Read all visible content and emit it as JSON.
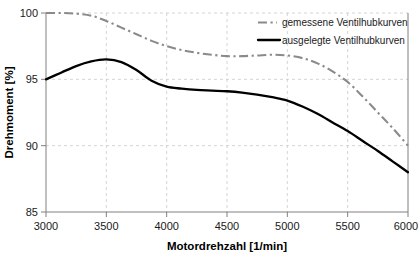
{
  "chart_data": {
    "type": "line",
    "title": "",
    "xlabel": "Motordrehzahl [1/min]",
    "ylabel": "Drehmoment [%]",
    "xlim": [
      3000,
      6000
    ],
    "ylim": [
      85,
      100
    ],
    "xticks": [
      3000,
      3500,
      4000,
      4500,
      5000,
      5500,
      6000
    ],
    "yticks": [
      85,
      90,
      95,
      100
    ],
    "xtick_labels": [
      "3000",
      "3500",
      "4000",
      "4500",
      "5000",
      "5500",
      "6000"
    ],
    "ytick_labels": [
      "85",
      "90",
      "95",
      "100"
    ],
    "grid": true,
    "grid_style": "dashed",
    "legend_position": "top-right",
    "series": [
      {
        "name": "gemessene Ventilhubkurven",
        "style": "dash-dot",
        "color": "#8a8a8a",
        "x": [
          3000,
          3125,
          3250,
          3375,
          3500,
          3625,
          3750,
          3875,
          4000,
          4125,
          4250,
          4375,
          4500,
          4625,
          4750,
          4875,
          5000,
          5125,
          5250,
          5375,
          5500,
          5625,
          5750,
          5875,
          6000
        ],
        "values": [
          100.0,
          100.0,
          99.95,
          99.8,
          99.4,
          98.9,
          98.4,
          97.9,
          97.5,
          97.2,
          97.0,
          96.85,
          96.75,
          96.75,
          96.8,
          96.85,
          96.8,
          96.6,
          96.2,
          95.6,
          94.8,
          93.7,
          92.5,
          91.3,
          90.0
        ]
      },
      {
        "name": "ausgelegte Ventilhubkurven",
        "style": "solid",
        "color": "#000000",
        "x": [
          3000,
          3125,
          3250,
          3375,
          3500,
          3625,
          3750,
          3875,
          4000,
          4125,
          4250,
          4375,
          4500,
          4625,
          4750,
          4875,
          5000,
          5125,
          5250,
          5375,
          5500,
          5625,
          5750,
          5875,
          6000
        ],
        "values": [
          95.0,
          95.5,
          96.0,
          96.35,
          96.5,
          96.3,
          95.7,
          94.9,
          94.45,
          94.3,
          94.2,
          94.15,
          94.1,
          94.0,
          93.85,
          93.65,
          93.4,
          92.95,
          92.4,
          91.75,
          91.1,
          90.35,
          89.6,
          88.8,
          88.0
        ]
      }
    ]
  },
  "legend": {
    "items": [
      {
        "label": "gemessene Ventilhubkurven",
        "swatch": "dash-dot-gray"
      },
      {
        "label": "ausgelegte Ventilhubkurven",
        "swatch": "solid-black"
      }
    ]
  },
  "axes": {
    "x_title": "Motordrehzahl [1/min]",
    "y_title": "Drehmoment [%]"
  }
}
